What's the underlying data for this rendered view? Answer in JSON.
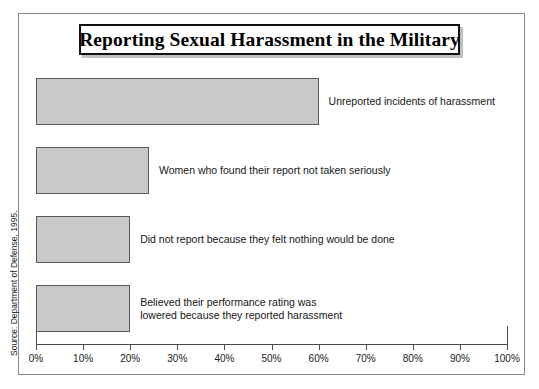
{
  "figure": {
    "title": "Reporting Sexual Harassment in the Military",
    "source_note": "Source: Department of Defense, 1995."
  },
  "chart_data": {
    "type": "bar",
    "orientation": "horizontal",
    "title": "Reporting Sexual Harassment in the Military",
    "xlabel": "",
    "ylabel": "",
    "xlim": [
      0,
      100
    ],
    "xtick_step": 10,
    "grid": false,
    "legend": "none",
    "units": "percent",
    "bar_color": "#c9c9c9",
    "bar_edge_color": "#5a5a5a",
    "categories": [
      "Unreported incidents of harassment",
      "Women who found their report not taken seriously",
      "Did not report because they felt nothing would be done",
      "Believed their performance rating was\nlowered because they reported harassment"
    ],
    "values": [
      60,
      24,
      20,
      20
    ],
    "tick_labels": [
      "0%",
      "10%",
      "20%",
      "30%",
      "40%",
      "50%",
      "60%",
      "70%",
      "80%",
      "90%",
      "100%"
    ],
    "tick_values": [
      0,
      10,
      20,
      30,
      40,
      50,
      60,
      70,
      80,
      90,
      100
    ],
    "bars": [
      {
        "label": "Unreported incidents of harassment",
        "value": 60
      },
      {
        "label": "Women who found their report not taken seriously",
        "value": 24
      },
      {
        "label": "Did not report because they felt nothing would be done",
        "value": 20
      },
      {
        "label": "Believed their performance rating was\nlowered because they reported harassment",
        "value": 20
      }
    ]
  }
}
